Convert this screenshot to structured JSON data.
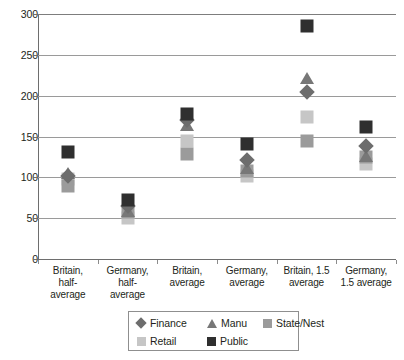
{
  "chart_data": {
    "type": "scatter",
    "title": "",
    "subtitle": "",
    "xlabel": "",
    "ylabel": "",
    "ylim": [
      0,
      300
    ],
    "yticks": [
      0,
      50,
      100,
      150,
      200,
      250,
      300
    ],
    "grid": true,
    "legend_position": "bottom",
    "categories": [
      "Britain, half-average",
      "Germany, half-average",
      "Britain, average",
      "Germany, average",
      "Britain, 1.5 average",
      "Germany, 1.5 average"
    ],
    "category_lines": [
      [
        "Britain,",
        "half-",
        "average"
      ],
      [
        "Germany,",
        "half-",
        "average"
      ],
      [
        "Britain,",
        "average"
      ],
      [
        "Germany,",
        "average"
      ],
      [
        "Britain, 1.5",
        "average"
      ],
      [
        "Germany,",
        "1.5 average"
      ]
    ],
    "series": [
      {
        "name": "Finance",
        "marker": "diamond",
        "color": "#6d6d6d",
        "values": [
          102,
          65,
          170,
          121,
          205,
          138
        ]
      },
      {
        "name": "Manu",
        "marker": "triangle",
        "color": "#777777",
        "values": [
          113,
          66,
          171,
          119,
          229,
          133
        ]
      },
      {
        "name": "State/Nest",
        "marker": "square",
        "color": "#9b9b9b",
        "values": [
          89,
          57,
          128,
          108,
          144,
          125
        ]
      },
      {
        "name": "Retail",
        "marker": "square",
        "color": "#c6c6c6",
        "values": [
          98,
          50,
          145,
          102,
          174,
          116
        ]
      },
      {
        "name": "Public",
        "marker": "square",
        "color": "#2f2f2f",
        "values": [
          131,
          72,
          178,
          141,
          285,
          162
        ]
      }
    ]
  },
  "axis": {
    "y_tick_labels": [
      "300",
      "250",
      "200",
      "150",
      "100",
      "50",
      "0"
    ]
  },
  "legend": {
    "items": [
      {
        "label": "Finance",
        "marker": "diamond",
        "color": "#6d6d6d"
      },
      {
        "label": "Manu",
        "marker": "triangle",
        "color": "#777777"
      },
      {
        "label": "State/Nest",
        "marker": "square",
        "color": "#9b9b9b"
      },
      {
        "label": "Retail",
        "marker": "square",
        "color": "#c6c6c6"
      },
      {
        "label": "Public",
        "marker": "square",
        "color": "#2f2f2f"
      }
    ]
  },
  "colors": {
    "gridline": "#9a9a9a",
    "axis": "#6e6e6e",
    "text": "#231f20",
    "background": "#ffffff"
  }
}
